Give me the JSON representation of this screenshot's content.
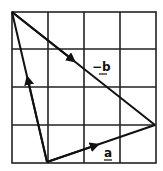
{
  "diagram": {
    "type": "vector-triangle-on-grid",
    "grid": {
      "columns": 4,
      "rows": 4,
      "x_lines": [
        12,
        48,
        84,
        120,
        156
      ],
      "y_lines": [
        12,
        49,
        87,
        125,
        163
      ],
      "line_color": "#222222"
    },
    "vertices": {
      "top_left": [
        12,
        12
      ],
      "bottom": [
        47,
        162
      ],
      "right": [
        155,
        125
      ]
    },
    "vectors": [
      {
        "id": "a",
        "label": "a",
        "from": "bottom",
        "to": "right",
        "label_pos": [
          104,
          158
        ]
      },
      {
        "id": "neg_b",
        "label": "−b",
        "from": "top_left",
        "to": "right",
        "label_pos": [
          92,
          72
        ]
      },
      {
        "id": "third",
        "label": "",
        "from": "bottom",
        "to": "top_left"
      }
    ],
    "labels": {
      "a": "a",
      "neg_b": "−b"
    },
    "stroke_color": "#111111"
  }
}
